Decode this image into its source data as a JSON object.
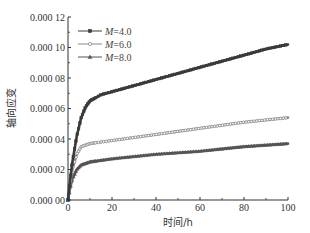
{
  "chart_data": {
    "type": "line",
    "title": "",
    "xlabel": "时间/h",
    "ylabel": "轴向应变",
    "xlim": [
      0,
      100
    ],
    "ylim": [
      0,
      0.00012
    ],
    "x_ticks": [
      0,
      20,
      40,
      60,
      80,
      100
    ],
    "x_tick_labels": [
      "0",
      "20",
      "40",
      "60",
      "80",
      "100"
    ],
    "y_ticks": [
      0,
      2e-05,
      4e-05,
      6e-05,
      8e-05,
      0.0001,
      0.00012
    ],
    "y_tick_labels": [
      "0.000 00",
      "0.000 02",
      "0.000 04",
      "0.000 06",
      "0.000 08",
      "0.000 10",
      "0.000 12"
    ],
    "grid": false,
    "legend_position": "upper left",
    "x": [
      0,
      1,
      2,
      4,
      6,
      8,
      10,
      15,
      20,
      30,
      40,
      50,
      60,
      70,
      80,
      90,
      100
    ],
    "series": [
      {
        "name": "M=4.0",
        "marker": "square",
        "color": "#3a3a3a",
        "values": [
          0,
          1.4e-05,
          2.5e-05,
          4.2e-05,
          5.4e-05,
          6.1e-05,
          6.5e-05,
          6.9e-05,
          7.1e-05,
          7.5e-05,
          7.9e-05,
          8.3e-05,
          8.7e-05,
          9.1e-05,
          9.5e-05,
          9.9e-05,
          0.000102
        ]
      },
      {
        "name": "M=6.0",
        "marker": "circle",
        "color": "#8a8a8a",
        "values": [
          0,
          1.1e-05,
          2e-05,
          3e-05,
          3.5e-05,
          3.6e-05,
          3.7e-05,
          3.8e-05,
          3.9e-05,
          4.1e-05,
          4.3e-05,
          4.5e-05,
          4.7e-05,
          4.9e-05,
          5.1e-05,
          5.25e-05,
          5.4e-05
        ]
      },
      {
        "name": "M=8.0",
        "marker": "triangle",
        "color": "#555555",
        "values": [
          0,
          8e-06,
          1.4e-05,
          2e-05,
          2.3e-05,
          2.4e-05,
          2.5e-05,
          2.6e-05,
          2.7e-05,
          2.85e-05,
          3e-05,
          3.1e-05,
          3.2e-05,
          3.35e-05,
          3.5e-05,
          3.6e-05,
          3.7e-05
        ]
      }
    ]
  },
  "legend": {
    "items": [
      {
        "var": "M",
        "value": "=4.0"
      },
      {
        "var": "M",
        "value": "=6.0"
      },
      {
        "var": "M",
        "value": "=8.0"
      }
    ]
  }
}
